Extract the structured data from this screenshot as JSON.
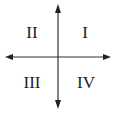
{
  "diagram": {
    "type": "coordinate-quadrants",
    "axis_color": "#333333",
    "quadrants": [
      {
        "id": "q1",
        "label": "I",
        "position": "top-right"
      },
      {
        "id": "q2",
        "label": "II",
        "position": "top-left"
      },
      {
        "id": "q3",
        "label": "III",
        "position": "bottom-left"
      },
      {
        "id": "q4",
        "label": "IV",
        "position": "bottom-right"
      }
    ]
  }
}
